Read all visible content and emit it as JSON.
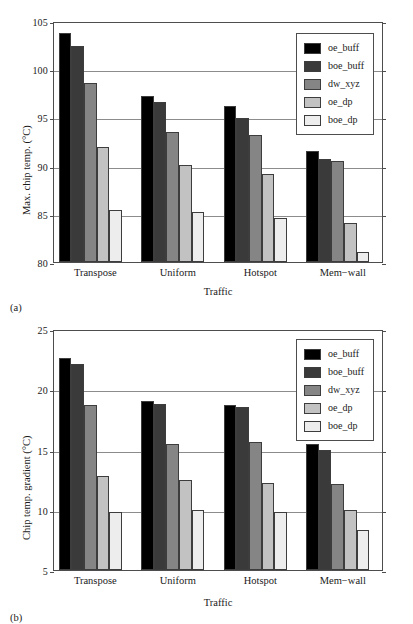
{
  "figure": {
    "panel_a_label": "(a)",
    "panel_b_label": "(b)"
  },
  "series_colors": {
    "oe_buff": "#000000",
    "boe_buff": "#3a3a3a",
    "dw_xyz": "#858585",
    "oe_dp": "#c2c2c2",
    "boe_dp": "#ededed"
  },
  "chart_data": [
    {
      "type": "bar",
      "panel": "(a)",
      "title": "",
      "xlabel": "Traffic",
      "ylabel": "Max. chip temp. (°C)",
      "ylim": [
        80,
        105
      ],
      "yticks": [
        80,
        85,
        90,
        95,
        100,
        105
      ],
      "ytick_labels": [
        "80",
        "85",
        "90",
        "95",
        "100",
        "105"
      ],
      "grid": true,
      "legend_position": "upper right",
      "categories": [
        "Transpose",
        "Uniform",
        "Hotspot",
        "Mem−wall"
      ],
      "series": [
        {
          "name": "oe_buff",
          "color": "#000000",
          "values": [
            103.8,
            97.2,
            96.2,
            91.5
          ]
        },
        {
          "name": "boe_buff",
          "color": "#3a3a3a",
          "values": [
            102.4,
            96.6,
            94.9,
            90.7
          ]
        },
        {
          "name": "dw_xyz",
          "color": "#858585",
          "values": [
            98.6,
            93.5,
            93.2,
            90.5
          ]
        },
        {
          "name": "oe_dp",
          "color": "#c2c2c2",
          "values": [
            91.9,
            90.1,
            89.1,
            84.1
          ]
        },
        {
          "name": "boe_dp",
          "color": "#ededed",
          "values": [
            85.4,
            85.2,
            84.6,
            81.0
          ]
        }
      ]
    },
    {
      "type": "bar",
      "panel": "(b)",
      "title": "",
      "xlabel": "Traffic",
      "ylabel": "Chip temp. gradient (°C)",
      "ylim": [
        5,
        25
      ],
      "yticks": [
        5,
        10,
        15,
        20,
        25
      ],
      "ytick_labels": [
        "5",
        "10",
        "15",
        "20",
        "25"
      ],
      "grid": true,
      "legend_position": "upper right",
      "categories": [
        "Transpose",
        "Uniform",
        "Hotspot",
        "Mem−wall"
      ],
      "series": [
        {
          "name": "oe_buff",
          "color": "#000000",
          "values": [
            22.6,
            19.0,
            18.7,
            15.5
          ]
        },
        {
          "name": "boe_buff",
          "color": "#3a3a3a",
          "values": [
            22.1,
            18.8,
            18.5,
            15.0
          ]
        },
        {
          "name": "dw_xyz",
          "color": "#858585",
          "values": [
            18.7,
            15.5,
            15.6,
            12.1
          ]
        },
        {
          "name": "oe_dp",
          "color": "#c2c2c2",
          "values": [
            12.8,
            12.5,
            12.2,
            10.0
          ]
        },
        {
          "name": "boe_dp",
          "color": "#ededed",
          "values": [
            9.8,
            10.0,
            9.8,
            8.3
          ]
        }
      ]
    }
  ]
}
